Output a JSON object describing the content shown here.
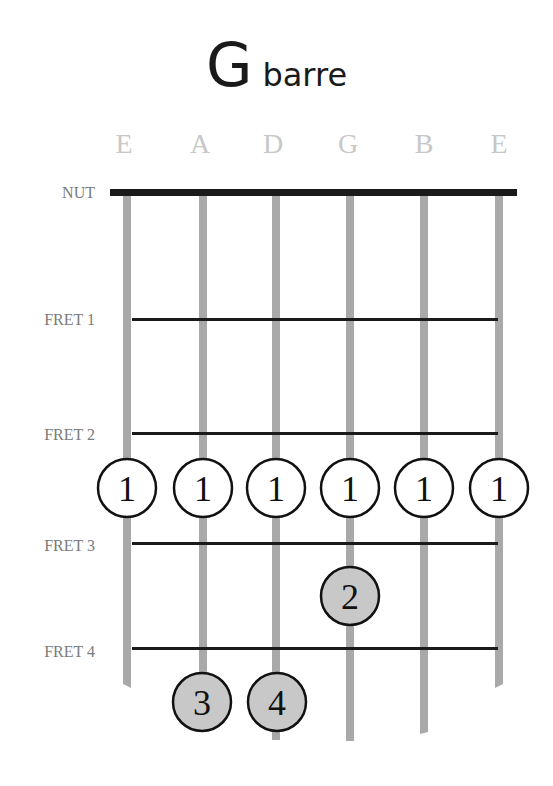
{
  "title": {
    "chord": "G",
    "suffix": "barre"
  },
  "strings": [
    "E",
    "A",
    "D",
    "G",
    "B",
    "E"
  ],
  "labels": {
    "nut": "NUT",
    "frets": [
      "FRET 1",
      "FRET 2",
      "FRET 3",
      "FRET 4"
    ]
  },
  "colors": {
    "string": "#a9a9a9",
    "fret": "#1a1a1a",
    "nut": "#1a1a1a",
    "barre_fill": "#ffffff",
    "finger_fill": "#c8c8c8",
    "label": "#7a7a7a",
    "string_name": "#c8c8c8"
  },
  "fingers": [
    {
      "string": 1,
      "fret": 3,
      "finger": "1",
      "type": "barre"
    },
    {
      "string": 2,
      "fret": 3,
      "finger": "1",
      "type": "barre"
    },
    {
      "string": 3,
      "fret": 3,
      "finger": "1",
      "type": "barre"
    },
    {
      "string": 4,
      "fret": 3,
      "finger": "1",
      "type": "barre"
    },
    {
      "string": 5,
      "fret": 3,
      "finger": "1",
      "type": "barre"
    },
    {
      "string": 6,
      "fret": 3,
      "finger": "1",
      "type": "barre"
    },
    {
      "string": 4,
      "fret": 4,
      "finger": "2",
      "type": "finger"
    },
    {
      "string": 2,
      "fret": 5,
      "finger": "3",
      "type": "finger"
    },
    {
      "string": 3,
      "fret": 5,
      "finger": "4",
      "type": "finger"
    }
  ]
}
